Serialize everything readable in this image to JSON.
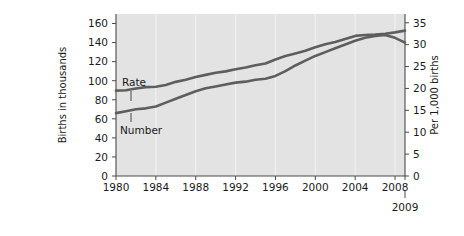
{
  "chart_data": {
    "type": "line",
    "title": "",
    "xlabel": "",
    "ylabel": "Births in thousands",
    "y2label": "Per 1,000 births",
    "grid": true,
    "legend_position": "inline-annotation",
    "plot_background": "#e3e3e3",
    "line_color": "#5e5e5e",
    "x": [
      1980,
      1981,
      1982,
      1983,
      1984,
      1985,
      1986,
      1987,
      1988,
      1989,
      1990,
      1991,
      1992,
      1993,
      1994,
      1995,
      1996,
      1997,
      1998,
      1999,
      2000,
      2001,
      2002,
      2003,
      2004,
      2005,
      2006,
      2007,
      2008,
      2009
    ],
    "xticks": [
      1980,
      1984,
      1988,
      1992,
      1996,
      2000,
      2004,
      2008
    ],
    "xtick_labels": [
      "1980",
      "1984",
      "1988",
      "1992",
      "1996",
      "2000",
      "2004",
      "2008"
    ],
    "final_year_label": "2009",
    "xlim": [
      1980,
      2009
    ],
    "ylim": [
      0,
      170
    ],
    "yticks": [
      0,
      20,
      40,
      60,
      80,
      100,
      120,
      140,
      160
    ],
    "ytick_labels": [
      "0",
      "20",
      "40",
      "60",
      "80",
      "100",
      "120",
      "140",
      "160"
    ],
    "y2lim": [
      0,
      37
    ],
    "y2ticks": [
      0,
      5,
      10,
      15,
      20,
      25,
      30,
      35
    ],
    "y2tick_labels": [
      "0",
      "5",
      "10",
      "15",
      "20",
      "25",
      "30",
      "35"
    ],
    "series": [
      {
        "name": "Rate",
        "axis": "right",
        "label": "Rate",
        "values": [
          19.5,
          19.6,
          20.0,
          20.3,
          20.4,
          20.8,
          21.5,
          22.0,
          22.6,
          23.1,
          23.6,
          23.9,
          24.4,
          24.8,
          25.3,
          25.7,
          26.6,
          27.4,
          28.0,
          28.6,
          29.4,
          30.1,
          30.6,
          31.3,
          32.0,
          32.2,
          32.3,
          32.5,
          32.8,
          33.2
        ]
      },
      {
        "name": "Number",
        "axis": "left",
        "label": "Number",
        "values": [
          66,
          68,
          70,
          71,
          73,
          77,
          81,
          85,
          89,
          92,
          94,
          96,
          98,
          99,
          101,
          102,
          105,
          110,
          116,
          121,
          126,
          130,
          134,
          138,
          142,
          145,
          147,
          148,
          145,
          140
        ]
      }
    ],
    "annotations": [
      {
        "text": "Rate",
        "points_to": "upper-line",
        "at_year": 1981
      },
      {
        "text": "Number",
        "points_to": "lower-line",
        "at_year": 1981
      }
    ]
  }
}
